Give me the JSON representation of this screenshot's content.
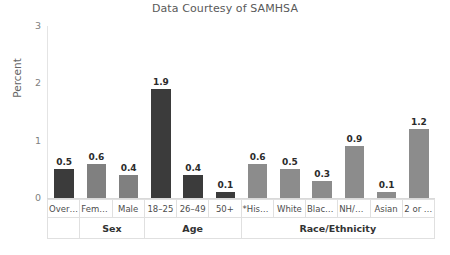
{
  "chart_data": {
    "type": "bar",
    "title": "Data Courtesy of SAMHSA",
    "xlabel": "",
    "ylabel": "Percent",
    "ylim": [
      0,
      3
    ],
    "yticks": [
      "0",
      "1",
      "2",
      "3"
    ],
    "grid": false,
    "legend": "none",
    "categories": [
      "Overall",
      "Female",
      "Male",
      "18–25",
      "26–49",
      "50+",
      "*Hisp…",
      "White",
      "Black …",
      "NH/OPI",
      "Asian",
      "2 or …"
    ],
    "values": [
      0.5,
      0.6,
      0.4,
      1.9,
      0.4,
      0.1,
      0.6,
      0.5,
      0.3,
      0.9,
      0.1,
      1.2
    ],
    "value_labels": [
      "0.5",
      "0.6",
      "0.4",
      "1.9",
      "0.4",
      "0.1",
      "0.6",
      "0.5",
      "0.3",
      "0.9",
      "0.1",
      "1.2"
    ],
    "bar_colors": [
      "#3b3b3b",
      "#808080",
      "#808080",
      "#3b3b3b",
      "#3b3b3b",
      "#3b3b3b",
      "#8c8c8c",
      "#8c8c8c",
      "#8c8c8c",
      "#8c8c8c",
      "#8c8c8c",
      "#8c8c8c"
    ],
    "groups": [
      {
        "label": "",
        "span": 1
      },
      {
        "label": "Sex",
        "span": 2
      },
      {
        "label": "Age",
        "span": 3
      },
      {
        "label": "Race/Ethnicity",
        "span": 6
      }
    ]
  },
  "colors": {
    "dark_bar": "#3b3b3b",
    "gray_bar": "#8c8c8c",
    "title_text": "#595959",
    "axis_text": "#808080",
    "grid_line": "#e0e0e0",
    "background": "#ffffff"
  }
}
